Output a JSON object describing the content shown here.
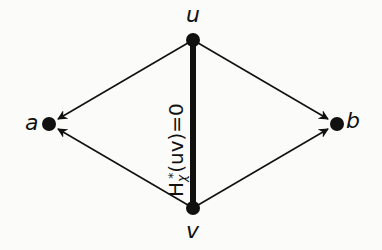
{
  "diagram": {
    "type": "directed-graph",
    "nodes": [
      {
        "id": "u",
        "label": "u",
        "x": 193,
        "y": 40
      },
      {
        "id": "v",
        "label": "v",
        "x": 193,
        "y": 208
      },
      {
        "id": "a",
        "label": "a",
        "x": 49,
        "y": 124
      },
      {
        "id": "b",
        "label": "b",
        "x": 337,
        "y": 124
      }
    ],
    "edges": [
      {
        "from": "u",
        "to": "a",
        "directed": true,
        "style": "thin"
      },
      {
        "from": "v",
        "to": "a",
        "directed": true,
        "style": "thin"
      },
      {
        "from": "u",
        "to": "b",
        "directed": true,
        "style": "thin"
      },
      {
        "from": "v",
        "to": "b",
        "directed": true,
        "style": "thin"
      },
      {
        "from": "u",
        "to": "v",
        "directed": false,
        "style": "thick",
        "label": "H_χ*(uv)=0"
      }
    ],
    "edge_label": {
      "base": "H",
      "subscript": "χ",
      "superscript": "*",
      "rest": "(uv)=0"
    },
    "colors": {
      "ink": "#111111",
      "background": "#fbfbf9"
    }
  }
}
